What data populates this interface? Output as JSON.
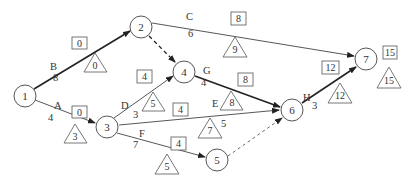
{
  "diagram": {
    "type": "activity-on-arrow network",
    "nodes": [
      {
        "id": "1",
        "x": 25,
        "y": 96
      },
      {
        "id": "2",
        "x": 141,
        "y": 27
      },
      {
        "id": "3",
        "x": 107,
        "y": 127
      },
      {
        "id": "4",
        "x": 184,
        "y": 72
      },
      {
        "id": "5",
        "x": 217,
        "y": 160
      },
      {
        "id": "6",
        "x": 292,
        "y": 110
      },
      {
        "id": "7",
        "x": 366,
        "y": 59
      }
    ],
    "activities": [
      {
        "name": "A",
        "from": "1",
        "to": "3",
        "duration": "4",
        "es_box": "0",
        "ls_triangle": "3",
        "critical": false
      },
      {
        "name": "B",
        "from": "1",
        "to": "2",
        "duration": "8",
        "es_box": "0",
        "ls_triangle": "0",
        "critical": true
      },
      {
        "name": "C",
        "from": "2",
        "to": "7",
        "duration": "6",
        "es_box": "8",
        "ls_triangle": "9",
        "critical": false
      },
      {
        "name": "D",
        "from": "3",
        "to": "4",
        "duration": "3",
        "es_box": "4",
        "ls_triangle": "5",
        "critical": false
      },
      {
        "name": "E",
        "from": "3",
        "to": "6",
        "duration": "5",
        "es_box": "4",
        "ls_triangle": "7",
        "critical": false
      },
      {
        "name": "F",
        "from": "3",
        "to": "5",
        "duration": "7",
        "es_box": "4",
        "ls_triangle": "5",
        "critical": false
      },
      {
        "name": "G",
        "from": "4",
        "to": "6",
        "duration": "4",
        "es_box": "8",
        "ls_triangle": "8",
        "critical": true
      },
      {
        "name": "H",
        "from": "6",
        "to": "7",
        "duration": "3",
        "es_box": "12",
        "ls_triangle": "12",
        "critical": true
      }
    ],
    "dummies": [
      {
        "from": "2",
        "to": "4",
        "critical": true
      },
      {
        "from": "5",
        "to": "6",
        "critical": false
      }
    ],
    "finish": {
      "box": "15",
      "triangle": "15"
    }
  }
}
